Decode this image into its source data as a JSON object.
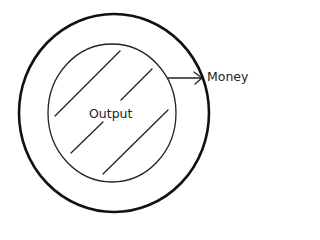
{
  "diagram": {
    "type": "circular-flow",
    "outer_circle": {
      "cx": 114,
      "cy": 113,
      "rx": 95,
      "ry": 99,
      "stroke": "#111111",
      "stroke_width": 2.6
    },
    "inner_circle": {
      "cx": 112,
      "cy": 113,
      "rx": 64,
      "ry": 69,
      "stroke": "#222222",
      "stroke_width": 1.3
    },
    "hatch_lines": [
      {
        "x1": 55,
        "y1": 116,
        "x2": 120,
        "y2": 51
      },
      {
        "x1": 121,
        "y1": 100,
        "x2": 152,
        "y2": 69
      },
      {
        "x1": 71,
        "y1": 153,
        "x2": 103,
        "y2": 122
      },
      {
        "x1": 103,
        "y1": 174,
        "x2": 168,
        "y2": 110
      }
    ],
    "arrow": {
      "x1": 168,
      "y1": 78,
      "x2": 202,
      "y2": 78
    },
    "labels": {
      "inner": "Output",
      "arrow": "Money"
    }
  }
}
